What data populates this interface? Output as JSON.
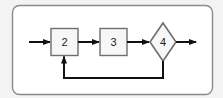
{
  "diagram": {
    "type": "flowchart",
    "colors": {
      "background": "#f3f3f3",
      "frame_fill": "#ffffff",
      "frame_stroke": "#8a8a8a",
      "node_fill": "#f7f7f7",
      "node_stroke": "#6e6e6e",
      "edge": "#111111",
      "text": "#222222"
    },
    "nodes": [
      {
        "id": "n2",
        "shape": "square",
        "label": "2"
      },
      {
        "id": "n3",
        "shape": "square",
        "label": "3"
      },
      {
        "id": "n4",
        "shape": "diamond",
        "label": "4"
      }
    ],
    "edges": [
      {
        "from": "input",
        "to": "n2"
      },
      {
        "from": "n2",
        "to": "n3"
      },
      {
        "from": "n3",
        "to": "n4"
      },
      {
        "from": "n4",
        "to": "output"
      },
      {
        "from": "n4",
        "to": "n2",
        "kind": "feedback-loop"
      }
    ]
  }
}
